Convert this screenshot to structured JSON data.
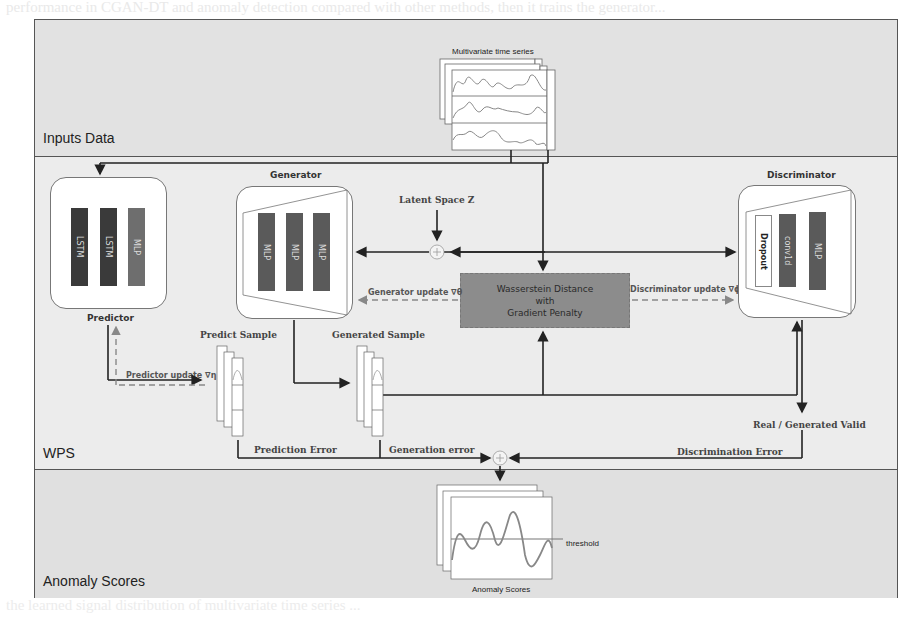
{
  "page": {
    "background_text_top": "performance in CGAN-DT and anomaly detection compared with other methods, then it trains the generator...",
    "background_text_bottom": "the learned signal distribution of multivariate time series ..."
  },
  "bands": {
    "inputs": {
      "label": "Inputs Data"
    },
    "wps": {
      "label": "WPS"
    },
    "anomaly": {
      "label": "Anomaly Scores"
    }
  },
  "inputs": {
    "series_title": "Multivariate  time series"
  },
  "predictor": {
    "title": "Predictor",
    "layers": [
      {
        "label": "LSTM",
        "color": "#3a3a3a"
      },
      {
        "label": "LSTM",
        "color": "#3a3a3a"
      },
      {
        "label": "MLP",
        "color": "#6e6e6e"
      }
    ],
    "update_label": "Predictor update ∇η"
  },
  "generator": {
    "title": "Generator",
    "layers": [
      {
        "label": "MLP",
        "color": "#5a5a5a"
      },
      {
        "label": "MLP",
        "color": "#5a5a5a"
      },
      {
        "label": "MLP",
        "color": "#5a5a5a"
      }
    ],
    "update_label": "Generator update ∇θ"
  },
  "latent": {
    "label": "Latent Space Z"
  },
  "discriminator": {
    "title": "Discriminator",
    "layers": [
      {
        "label": "Dropout",
        "color": "#ffffff"
      },
      {
        "label": "conv1d",
        "color": "#5a5a5a"
      },
      {
        "label": "MLP",
        "color": "#5a5a5a"
      }
    ],
    "update_label": "Discriminator update ∇ϕ"
  },
  "wasserstein": {
    "line1": "Wasserstein Distance",
    "line2": "with",
    "line3": "Gradient Penalty"
  },
  "samples": {
    "predict": "Predict Sample",
    "generated": "Generated Sample"
  },
  "errors": {
    "prediction": "Prediction Error",
    "generation": "Generation error",
    "discrimination": "Discrimination Error",
    "real_generated": "Real / Generated Valid"
  },
  "anomaly": {
    "caption": "Anomaly Scores",
    "threshold": "threshold"
  }
}
